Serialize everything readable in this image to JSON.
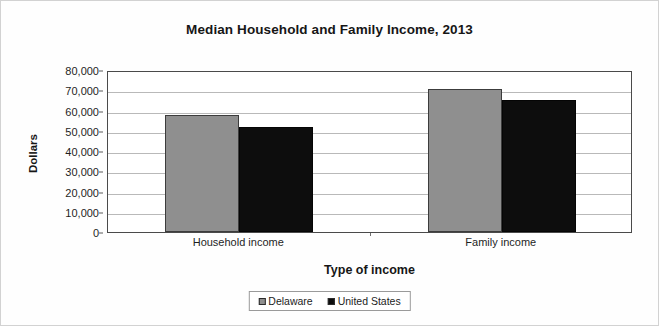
{
  "chart_data": {
    "type": "bar",
    "title": "Median Household and Family Income, 2013",
    "xlabel": "Type of income",
    "ylabel": "Dollars",
    "categories": [
      "Household income",
      "Family income"
    ],
    "series": [
      {
        "name": "Delaware",
        "color": "#8f8f8f",
        "values": [
          58000,
          70500
        ]
      },
      {
        "name": "United States",
        "color": "#0d0d0d",
        "values": [
          52000,
          65000
        ]
      }
    ],
    "ylim": [
      0,
      80000
    ],
    "ytick_values": [
      0,
      10000,
      20000,
      30000,
      40000,
      50000,
      60000,
      70000,
      80000
    ],
    "ytick_labels": [
      "0",
      "10,000",
      "20,000",
      "30,000",
      "40,000",
      "50,000",
      "60,000",
      "70,000",
      "80,000"
    ],
    "grid": true,
    "legend_position": "bottom"
  },
  "legend": {
    "items": [
      {
        "label": "Delaware",
        "swatch": "legend-swatch-delaware"
      },
      {
        "label": "United States",
        "swatch": "legend-swatch-us"
      }
    ]
  }
}
